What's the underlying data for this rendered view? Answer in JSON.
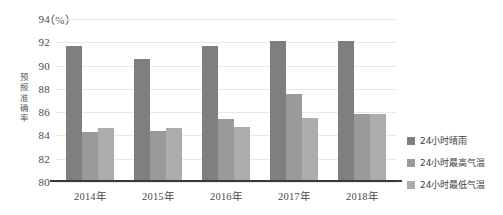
{
  "chart_data": {
    "type": "bar",
    "title": "",
    "xlabel": "",
    "ylabel": "预报准确率",
    "unit_label": "（%）",
    "ylim": [
      80,
      94
    ],
    "yticks": [
      80,
      82,
      84,
      86,
      88,
      90,
      92,
      94
    ],
    "ytick_labels": [
      "80",
      "82",
      "84",
      "86",
      "88",
      "90",
      "92",
      "94"
    ],
    "grid": true,
    "legend_position": "right",
    "categories": [
      "2014年",
      "2015年",
      "2016年",
      "2017年",
      "2018年"
    ],
    "series": [
      {
        "name": "24小时晴雨",
        "color": "#7f7f7f",
        "values": [
          91.7,
          90.6,
          91.7,
          92.1,
          92.1
        ]
      },
      {
        "name": "24小时最高气温",
        "color": "#9a9a9a",
        "values": [
          84.3,
          84.4,
          85.4,
          87.6,
          85.8
        ]
      },
      {
        "name": "24小时最低气温",
        "color": "#acacac",
        "values": [
          84.6,
          84.6,
          84.7,
          85.5,
          85.8
        ]
      }
    ]
  }
}
